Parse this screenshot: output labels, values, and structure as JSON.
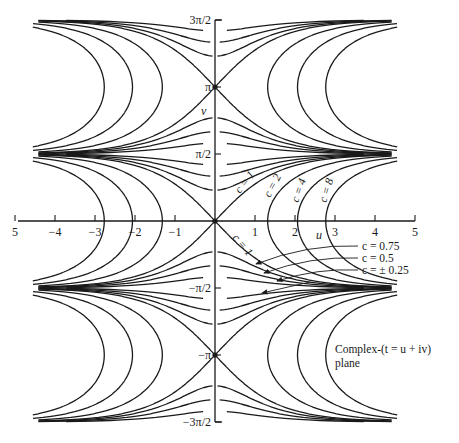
{
  "figure": {
    "title": "Complex-(t = u + iv) plane",
    "caption_line1": "Complex-(t = u + iv)",
    "caption_line2": "plane",
    "function_contoured": "cos(v)·cosh(u) = c",
    "axes": {
      "u_label": "u",
      "v_label": "v",
      "u_ticks": [
        {
          "value": -5,
          "label": "5"
        },
        {
          "value": -4,
          "label": "−4"
        },
        {
          "value": -3,
          "label": "−3"
        },
        {
          "value": -2,
          "label": "−2"
        },
        {
          "value": -1,
          "label": "−1"
        },
        {
          "value": 1,
          "label": "1"
        },
        {
          "value": 2,
          "label": "2"
        },
        {
          "value": 3,
          "label": "3"
        },
        {
          "value": 4,
          "label": "4"
        },
        {
          "value": 5,
          "label": "5"
        }
      ],
      "v_ticks": [
        {
          "value": 1.5,
          "label": "3π/2"
        },
        {
          "value": 1.0,
          "label": "π"
        },
        {
          "value": 0.5,
          "label": "π/2"
        },
        {
          "value": -0.5,
          "label": "−π/2"
        },
        {
          "value": -1.0,
          "label": "−π"
        },
        {
          "value": -1.5,
          "label": "−3π/2"
        }
      ],
      "u_range": [
        -5,
        5
      ],
      "v_range_over_pi": [
        -1.5,
        1.5
      ]
    },
    "contour_levels": [
      0.25,
      0.5,
      0.75,
      1,
      2,
      4,
      8
    ],
    "curve_labels": [
      {
        "text": "c = 1",
        "x": 240,
        "y": 194,
        "rotate": -52
      },
      {
        "text": "c = 2",
        "x": 270,
        "y": 198,
        "rotate": -62
      },
      {
        "text": "c = 4",
        "x": 298,
        "y": 203,
        "rotate": -70
      },
      {
        "text": "c = 8",
        "x": 326,
        "y": 203,
        "rotate": -72
      },
      {
        "text": "c = 1",
        "x": 232,
        "y": 238,
        "rotate": 50
      }
    ],
    "legend_callouts": [
      {
        "text": "c = 0.75",
        "tx": 362,
        "ty": 250,
        "ax": 256,
        "ay": 264
      },
      {
        "text": "c = 0.5",
        "tx": 362,
        "ty": 262,
        "ax": 264,
        "ay": 273
      },
      {
        "text": "c = ± 0.25",
        "tx": 362,
        "ty": 274,
        "ax": 277,
        "ay": 281
      }
    ],
    "extra_arrow": {
      "ax": 262,
      "ay": 293,
      "fromx": 310,
      "fromy": 282
    },
    "colors": {
      "ink": "#1a1a1a",
      "background": "#ffffff"
    }
  }
}
